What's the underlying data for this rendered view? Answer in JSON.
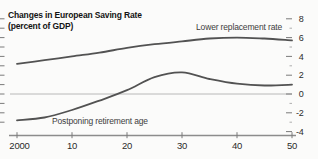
{
  "title": {
    "line1": "Changes in European Saving Rate",
    "line2": "(percent of GDP)"
  },
  "chart_data": {
    "type": "line",
    "title": "Changes in European Saving Rate (percent of GDP)",
    "x": [
      2000,
      2005,
      2010,
      2015,
      2020,
      2025,
      2030,
      2035,
      2040,
      2045,
      2050
    ],
    "series": [
      {
        "name": "Lower replacement rate",
        "values": [
          3.2,
          3.6,
          4.0,
          4.4,
          4.9,
          5.3,
          5.6,
          5.9,
          6.0,
          5.9,
          5.7
        ]
      },
      {
        "name": "Postponing retirement age",
        "values": [
          -2.8,
          -2.5,
          -1.7,
          -0.7,
          0.4,
          1.8,
          2.3,
          1.6,
          1.1,
          0.9,
          1.0
        ]
      }
    ],
    "xlabel": "",
    "ylabel": "",
    "xlim": [
      2000,
      2050
    ],
    "ylim": [
      -4.5,
      8.7
    ],
    "x_ticks": {
      "values": [
        2000,
        2010,
        2020,
        2030,
        2040,
        2050
      ],
      "labels": [
        "2000",
        "10",
        "20",
        "30",
        "40",
        "50"
      ]
    },
    "y_ticks": {
      "side": "right",
      "values": [
        8,
        6,
        4,
        2,
        0,
        -2,
        -4
      ],
      "labels": [
        "8",
        "6",
        "4",
        "2",
        "0",
        "-2",
        "-4"
      ],
      "minor_values": [
        7,
        5,
        3,
        1,
        -1,
        -3
      ]
    },
    "left_minor_tick_values": [
      8,
      7,
      6,
      5,
      4,
      3,
      2,
      1,
      0,
      -1,
      -2,
      -3
    ],
    "zero_line": true,
    "grid": false,
    "legend_position": "inline-annotations",
    "colors": {
      "series_line": "#525252",
      "zero_line": "#b8b8b8",
      "axis_line": "#8c8c8c",
      "tick": "#7a7a7a",
      "minor_tick": "#9a9a9a",
      "tick_label": "#2b2b2b",
      "background": "#fbfbfa"
    }
  }
}
